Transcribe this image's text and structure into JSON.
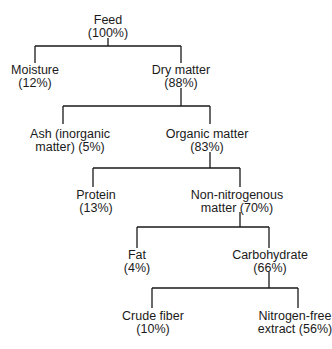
{
  "diagram": {
    "type": "tree",
    "nodes": {
      "feed": {
        "line1": "Feed",
        "line2": "(100%)"
      },
      "moisture": {
        "line1": "Moisture",
        "line2": "(12%)"
      },
      "dry_matter": {
        "line1": "Dry matter",
        "line2": "(88%)"
      },
      "ash": {
        "line1": "Ash (inorganic",
        "line2": "matter) (5%)"
      },
      "organic_matter": {
        "line1": "Organic matter",
        "line2": "(83%)"
      },
      "protein": {
        "line1": "Protein",
        "line2": "(13%)"
      },
      "non_nitrogenous": {
        "line1": "Non-nitrogenous",
        "line2": "matter (70%)"
      },
      "fat": {
        "line1": "Fat",
        "line2": "(4%)"
      },
      "carbohydrate": {
        "line1": "Carbohydrate",
        "line2": "(66%)"
      },
      "crude_fiber": {
        "line1": "Crude fiber",
        "line2": "(10%)"
      },
      "nfe": {
        "line1": "Nitrogen-free",
        "line2": "extract (56%)"
      }
    },
    "edges": [
      [
        "feed",
        "moisture"
      ],
      [
        "feed",
        "dry_matter"
      ],
      [
        "dry_matter",
        "ash"
      ],
      [
        "dry_matter",
        "organic_matter"
      ],
      [
        "organic_matter",
        "protein"
      ],
      [
        "organic_matter",
        "non_nitrogenous"
      ],
      [
        "non_nitrogenous",
        "fat"
      ],
      [
        "non_nitrogenous",
        "carbohydrate"
      ],
      [
        "carbohydrate",
        "crude_fiber"
      ],
      [
        "carbohydrate",
        "nfe"
      ]
    ],
    "line_color": "#1a1a1a"
  }
}
